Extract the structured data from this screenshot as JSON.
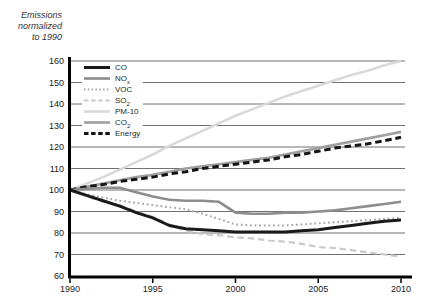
{
  "figure": {
    "ylabel_lines": [
      "Emissions",
      "normalized",
      "to 1990"
    ]
  },
  "chart_data": {
    "type": "line",
    "title": "",
    "ylabel": "Emissions normalized to 1990",
    "xlabel": "",
    "xlim": [
      1990,
      2010
    ],
    "ylim": [
      60,
      160
    ],
    "xticks": [
      1990,
      1995,
      2000,
      2005,
      2010
    ],
    "yticks": [
      60,
      70,
      80,
      90,
      100,
      110,
      120,
      130,
      140,
      150,
      160
    ],
    "grid": true,
    "legend_position": "top-left",
    "grid_color": "#4d4d4d",
    "axis_color": "#000000",
    "tick_label_color": "#1a1a1a",
    "x": [
      1990,
      1991,
      1992,
      1993,
      1994,
      1995,
      1996,
      1997,
      1998,
      1999,
      2000,
      2001,
      2002,
      2003,
      2004,
      2005,
      2006,
      2007,
      2008,
      2009,
      2010
    ],
    "series": [
      {
        "key": "co",
        "name": "CO",
        "label": [
          {
            "t": "CO"
          }
        ],
        "color": "#1a1a1a",
        "style": "solid",
        "width": 3,
        "values": [
          100,
          97.5,
          95,
          92.5,
          89.5,
          87,
          83.5,
          82,
          81.5,
          81,
          80.5,
          80.5,
          80.5,
          80.5,
          81,
          81.5,
          82.5,
          83.5,
          84.5,
          85.5,
          86
        ]
      },
      {
        "key": "nox",
        "name": "NOx",
        "label": [
          {
            "t": "NO"
          },
          {
            "t": "x",
            "sub": true
          }
        ],
        "color": "#8d8d8d",
        "style": "solid",
        "width": 2.6,
        "values": [
          100,
          100.5,
          101,
          101,
          99,
          97,
          95.5,
          95,
          95,
          94.5,
          89.5,
          89,
          89,
          89.5,
          89.5,
          90,
          90.5,
          91.5,
          92.5,
          93.5,
          94.5
        ]
      },
      {
        "key": "voc",
        "name": "VOC",
        "label": [
          {
            "t": "VOC"
          }
        ],
        "color": "#a6a6a6",
        "style": "dotted",
        "width": 2,
        "values": [
          100,
          98,
          96.5,
          95,
          94,
          93,
          92,
          91,
          89,
          86.5,
          84,
          83.5,
          83.5,
          83.5,
          84,
          84.5,
          85,
          85.5,
          86,
          86.5,
          87
        ]
      },
      {
        "key": "so2",
        "name": "SO2",
        "label": [
          {
            "t": "SO"
          },
          {
            "t": "2",
            "sub": true
          }
        ],
        "color": "#c9c9c9",
        "style": "dashed",
        "width": 2.2,
        "values": [
          100,
          97,
          94.5,
          93,
          90,
          87.5,
          84,
          81,
          79.5,
          79,
          78,
          77.5,
          76.5,
          76,
          75,
          73.5,
          73,
          72,
          71,
          70,
          69
        ]
      },
      {
        "key": "pm10",
        "name": "PM-10",
        "label": [
          {
            "t": "PM-10"
          }
        ],
        "color": "#d9d9d9",
        "style": "solid",
        "width": 2.6,
        "values": [
          100,
          103,
          106,
          109.5,
          113,
          116.5,
          120.5,
          124,
          127.5,
          131,
          134.5,
          137.5,
          140.5,
          143.5,
          146,
          148.5,
          151,
          153.5,
          155.5,
          158,
          160
        ]
      },
      {
        "key": "co2",
        "name": "CO2",
        "label": [
          {
            "t": "CO"
          },
          {
            "t": "2",
            "sub": true
          }
        ],
        "color": "#9f9f9f",
        "style": "solid",
        "width": 2.6,
        "values": [
          100,
          101.5,
          103,
          104.5,
          106,
          107,
          108.5,
          110,
          111,
          112,
          113,
          114,
          115,
          116.5,
          118,
          119.5,
          121,
          122.5,
          124,
          125.5,
          127
        ]
      },
      {
        "key": "energy",
        "name": "Energy",
        "label": [
          {
            "t": "Energy"
          }
        ],
        "color": "#141414",
        "style": "dashed",
        "width": 3,
        "values": [
          100,
          101.5,
          102.5,
          104,
          105,
          106,
          107.5,
          108.5,
          110,
          111,
          112,
          113,
          114,
          115.5,
          116.5,
          118,
          119.5,
          120.5,
          121.5,
          123,
          124.5
        ]
      }
    ]
  }
}
